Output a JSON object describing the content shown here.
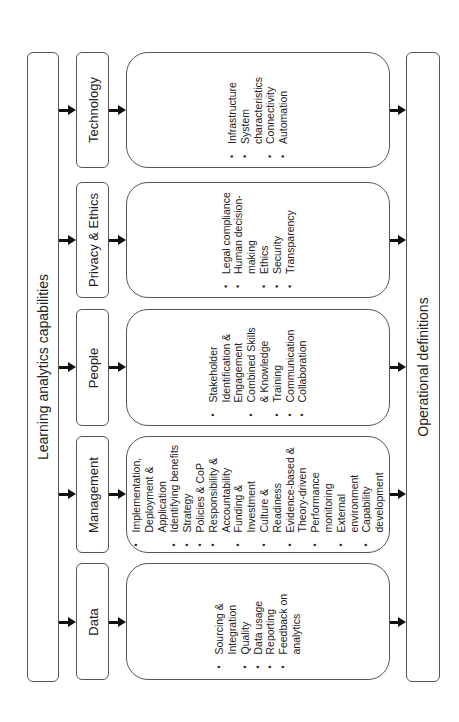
{
  "left_bar": {
    "label": "Learning analytics capabilities"
  },
  "right_bar": {
    "label": "Operational definitions"
  },
  "capabilities": [
    {
      "id": "technology",
      "label": "Technology",
      "items": [
        "Infrastructure",
        "System characteristics",
        "Connectivity",
        "Automation"
      ]
    },
    {
      "id": "privacy-ethics",
      "label": "Privacy & Ethics",
      "items": [
        "Legal compliance",
        "Human decision-making",
        "Ethics",
        "Security",
        "Transparency"
      ]
    },
    {
      "id": "people",
      "label": "People",
      "items": [
        "Stakeholder Identification & Engagement",
        "Combined Skills & Knowledge",
        "Training",
        "Communication",
        "Collaboration"
      ]
    },
    {
      "id": "management",
      "label": "Management",
      "items": [
        "Implementation, Deployment & Application",
        "Identifying benefits",
        "Strategy",
        "Policies & CoP",
        "Responsibility & Accountability",
        "Funding & Investment",
        "Culture & Readiness",
        "Evidence-based & Theory-driven",
        "Performance monitoring",
        "External environment",
        "Capability development"
      ]
    },
    {
      "id": "data",
      "label": "Data",
      "items": [
        "Sourcing & Integration",
        "Quality",
        "Data usage",
        "Reporting",
        "Feedback on analytics"
      ]
    }
  ]
}
